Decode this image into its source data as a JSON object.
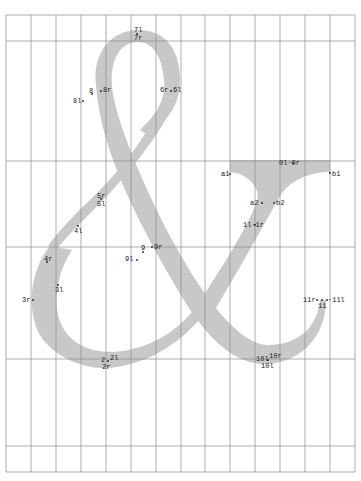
{
  "figure": {
    "glyph_color": "#c8c8c8",
    "grid_color": "#8a8a8a",
    "grid": {
      "left": 6,
      "right": 355,
      "top": 15,
      "bottom": 472,
      "vertical_x": [
        6,
        31,
        56,
        81,
        106,
        131,
        156,
        181,
        205,
        230,
        255,
        280,
        305,
        330,
        355
      ],
      "horizontal_y": [
        15,
        41,
        161,
        247,
        359,
        446,
        472
      ]
    }
  },
  "points": [
    {
      "id": "7l",
      "label": "7l",
      "x": 134,
      "y": 27
    },
    {
      "id": "7r",
      "label": "7r",
      "x": 134,
      "y": 36
    },
    {
      "id": "8",
      "label": "8",
      "x": 89,
      "y": 90
    },
    {
      "id": "8r",
      "label": "8r",
      "x": 102,
      "y": 89
    },
    {
      "id": "8l",
      "label": "8l",
      "x": 73,
      "y": 99
    },
    {
      "id": "6r",
      "label": "6r",
      "x": 160,
      "y": 89
    },
    {
      "id": "6l",
      "label": "6l",
      "x": 172,
      "y": 89
    },
    {
      "id": "5r",
      "label": "5r",
      "x": 97,
      "y": 193
    },
    {
      "id": "5l",
      "label": "5l",
      "x": 97,
      "y": 201
    },
    {
      "id": "4l",
      "label": "4l",
      "x": 74,
      "y": 228
    },
    {
      "id": "9",
      "label": "9",
      "x": 141,
      "y": 246
    },
    {
      "id": "9r",
      "label": "9r",
      "x": 154,
      "y": 245
    },
    {
      "id": "9l",
      "label": "9l",
      "x": 125,
      "y": 257
    },
    {
      "id": "4r",
      "label": "4r",
      "x": 44,
      "y": 256
    },
    {
      "id": "3l",
      "label": "3l",
      "x": 55,
      "y": 287
    },
    {
      "id": "3r",
      "label": "3r",
      "x": 22,
      "y": 298
    },
    {
      "id": "a1",
      "label": "a1",
      "x": 221,
      "y": 172
    },
    {
      "id": "0l0r",
      "label": "0l·0r",
      "x": 279,
      "y": 161
    },
    {
      "id": "b1",
      "label": "b1",
      "x": 330,
      "y": 172
    },
    {
      "id": "a2",
      "label": "a2",
      "x": 250,
      "y": 201
    },
    {
      "id": "b2",
      "label": "b2",
      "x": 275,
      "y": 201
    },
    {
      "id": "1l1r",
      "label": "1l·1r",
      "x": 243,
      "y": 222
    },
    {
      "id": "11r",
      "label": "11r",
      "x": 303,
      "y": 298
    },
    {
      "id": "111",
      "label": "·11l",
      "x": 326,
      "y": 298
    },
    {
      "id": "11",
      "label": "11",
      "x": 318,
      "y": 304
    },
    {
      "id": "2",
      "label": "2",
      "x": 101,
      "y": 358
    },
    {
      "id": "2l",
      "label": "2l",
      "x": 110,
      "y": 356
    },
    {
      "id": "2r",
      "label": "2r",
      "x": 103,
      "y": 365
    },
    {
      "id": "10l",
      "label": "10l",
      "x": 256,
      "y": 357
    },
    {
      "id": "10r",
      "label": "10r",
      "x": 269,
      "y": 354
    },
    {
      "id": "10lb",
      "label": "10l",
      "x": 261,
      "y": 364
    }
  ]
}
